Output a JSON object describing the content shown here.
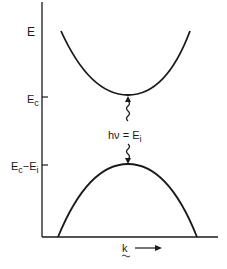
{
  "diagram": {
    "type": "energy-band-diagram",
    "axes": {
      "y_label": "E",
      "x_label": "k",
      "x_arrow": "right"
    },
    "levels": [
      {
        "id": "conduction",
        "label_main": "E",
        "label_sub": "c",
        "y_tick": "E_c"
      },
      {
        "id": "valence_top",
        "label_main": "E",
        "label_sub": "c",
        "label_rest": "−E",
        "label_sub2": "i",
        "y_tick": "E_c - E_i"
      }
    ],
    "transition": {
      "label": "hν = E",
      "label_sub": "i",
      "style": "wavy-arrows"
    },
    "bands": [
      {
        "name": "conduction-band",
        "shape": "upward-parabola"
      },
      {
        "name": "valence-band",
        "shape": "downward-parabola"
      }
    ],
    "colors": {
      "line": "#1a1a1a",
      "background": "#ffffff"
    }
  }
}
